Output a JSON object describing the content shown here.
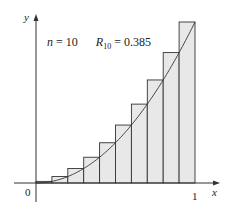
{
  "chart_data": {
    "type": "bar",
    "title": "",
    "annotation": "n = 10   R10 = 0.385",
    "n": 10,
    "R10": 0.385,
    "function": "y = x^2",
    "xlabel": "x",
    "ylabel": "y",
    "x_ticks": [
      "0",
      "1"
    ],
    "xlim": [
      0,
      1
    ],
    "ylim": [
      0,
      1
    ],
    "categories": [
      "0.0-0.1",
      "0.1-0.2",
      "0.2-0.3",
      "0.3-0.4",
      "0.4-0.5",
      "0.5-0.6",
      "0.6-0.7",
      "0.7-0.8",
      "0.8-0.9",
      "0.9-1.0"
    ],
    "values": [
      0.01,
      0.04,
      0.09,
      0.16,
      0.25,
      0.36,
      0.49,
      0.64,
      0.81,
      1.0
    ],
    "bar_fill": "#e8e8e8",
    "bar_stroke": "#333333",
    "grid": false,
    "legend": "none"
  },
  "labels": {
    "y_axis": "y",
    "x_axis": "x",
    "origin": "0",
    "x_one": "1",
    "n_label": "n",
    "n_value": "= 10",
    "r_label": "R",
    "r_sub": "10",
    "r_value": "= 0.385"
  }
}
